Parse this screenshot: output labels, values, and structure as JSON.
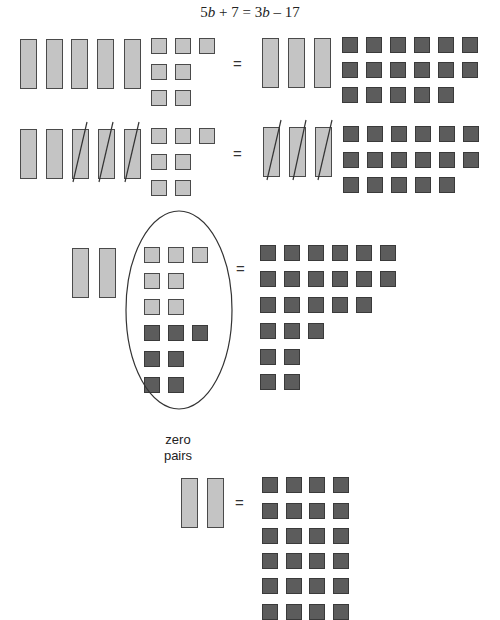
{
  "title": {
    "equation_parts": [
      "5",
      "b",
      " + 7 = 3",
      "b",
      " – 17"
    ],
    "full": "5b + 7 = 3b – 17"
  },
  "equals_sign": "=",
  "zero_pairs_label": [
    "zero",
    "pairs"
  ],
  "colors": {
    "bar_fill": "#c4c4c4",
    "positive_unit_fill": "#c4c4c4",
    "negative_unit_fill": "#5c5c5c",
    "outline": "#4a4a4a"
  },
  "steps": [
    {
      "name": "step-1",
      "left": {
        "bars": 5,
        "crossed_bars": 0,
        "positive_units": 7,
        "unit_rows": [
          3,
          2,
          2
        ]
      },
      "right": {
        "bars": 3,
        "crossed_bars": 0,
        "negative_units": 17,
        "unit_rows": [
          6,
          6,
          5
        ]
      }
    },
    {
      "name": "step-2-remove-3b",
      "left": {
        "bars": 5,
        "crossed_bars": 3,
        "positive_units": 7,
        "unit_rows": [
          3,
          2,
          2
        ]
      },
      "right": {
        "bars": 3,
        "crossed_bars": 3,
        "negative_units": 17,
        "unit_rows": [
          6,
          6,
          5
        ]
      }
    },
    {
      "name": "step-3-add-7-negatives",
      "left": {
        "bars": 2,
        "positive_units": 7,
        "positive_rows": [
          3,
          2,
          2
        ],
        "negative_units": 7,
        "negative_rows": [
          3,
          2,
          2
        ],
        "circled_as": "zero pairs"
      },
      "right": {
        "negative_units": 24,
        "unit_rows": [
          6,
          6,
          5,
          3,
          2,
          2
        ]
      }
    },
    {
      "name": "step-4-result",
      "left": {
        "bars": 2
      },
      "right": {
        "negative_units": 24,
        "unit_rows": [
          4,
          4,
          4,
          4,
          4,
          4
        ]
      }
    }
  ]
}
